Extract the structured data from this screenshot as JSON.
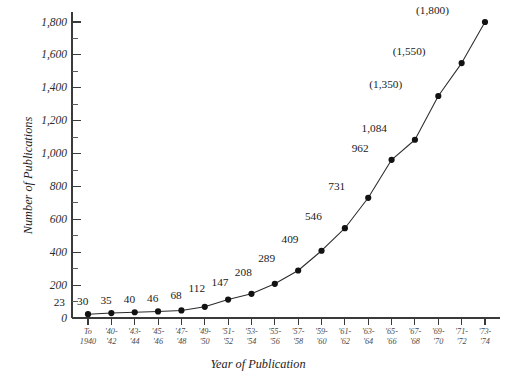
{
  "chart_data": {
    "type": "line",
    "title": "",
    "xlabel": "Year of Publication",
    "ylabel": "Number of Publications",
    "grid": false,
    "legend": "none",
    "ylim": [
      0,
      1800
    ],
    "ytick_step": 200,
    "yminor_step": 100,
    "ytick_labels": [
      "0",
      "200",
      "400",
      "600",
      "800",
      "1,000",
      "1,200",
      "1,400",
      "1,600",
      "1,800"
    ],
    "ytick_values": [
      0,
      200,
      400,
      600,
      800,
      1000,
      1200,
      1400,
      1600,
      1800
    ],
    "categories": [
      "To 1940",
      "'40-'42",
      "'43-'44",
      "'45-'46",
      "'47-'48",
      "'49-'50",
      "'51-'52",
      "'53-'54",
      "'55-'56",
      "'57-'58",
      "'59-'60",
      "'61-'62",
      "'63-'64",
      "'65-'66",
      "'67-'68",
      "'69-'70",
      "'71-'72",
      "'73-'74"
    ],
    "category_lines": [
      [
        "To",
        "1940"
      ],
      [
        "'40-",
        "'42"
      ],
      [
        "'43-",
        "'44"
      ],
      [
        "'45-",
        "'46"
      ],
      [
        "'47-",
        "'48"
      ],
      [
        "'49-",
        "'50"
      ],
      [
        "'51-",
        "'52"
      ],
      [
        "'53-",
        "'54"
      ],
      [
        "'55-",
        "'56"
      ],
      [
        "'57-",
        "'58"
      ],
      [
        "'59-",
        "'60"
      ],
      [
        "'61-",
        "'62"
      ],
      [
        "'63-",
        "'64"
      ],
      [
        "'65-",
        "'66"
      ],
      [
        "'67-",
        "'68"
      ],
      [
        "'69-",
        "'70"
      ],
      [
        "'71-",
        "'72"
      ],
      [
        "'73-",
        "'74"
      ]
    ],
    "values": [
      23,
      30,
      35,
      40,
      46,
      68,
      112,
      147,
      208,
      289,
      409,
      546,
      731,
      962,
      1084,
      1350,
      1550,
      1800
    ],
    "point_labels": [
      "23",
      "30",
      "35",
      "40",
      "46",
      "68",
      "112",
      "147",
      "208",
      "289",
      "409",
      "546",
      "731",
      "962",
      "1,084",
      "(1,350)",
      "(1,550)",
      "(1,800)"
    ],
    "estimated_points": [
      15,
      16,
      17
    ],
    "marker": "filled-circle",
    "line_color": "#2b2b2b",
    "marker_color": "#121212"
  },
  "axis": {
    "y_title": "Number of Publications",
    "x_title": "Year of Publication"
  }
}
